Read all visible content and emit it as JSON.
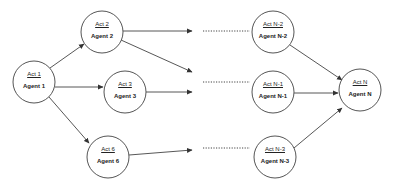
{
  "diagram": {
    "nodes": [
      {
        "id": "act1",
        "act": "Act 1",
        "agent": "Agent 1",
        "cx": 34,
        "cy": 82
      },
      {
        "id": "act2",
        "act": "Act 2",
        "agent": "Agent 2",
        "cx": 102,
        "cy": 32
      },
      {
        "id": "act3",
        "act": "Act 3",
        "agent": "Agent 3",
        "cx": 125,
        "cy": 92
      },
      {
        "id": "act6",
        "act": "Act 6",
        "agent": "Agent 6",
        "cx": 108,
        "cy": 157
      },
      {
        "id": "actn2",
        "act": "Act N-2",
        "agent": "Agent N-2",
        "cx": 273,
        "cy": 32
      },
      {
        "id": "actn1",
        "act": "Act N-1",
        "agent": "Agent N-1",
        "cx": 273,
        "cy": 92
      },
      {
        "id": "actn3",
        "act": "Act N-3",
        "agent": "Agent N-3",
        "cx": 275,
        "cy": 157
      },
      {
        "id": "actn",
        "act": "Act N",
        "agent": "Agent N",
        "cx": 360,
        "cy": 90
      }
    ],
    "edges": [
      {
        "from": "act1",
        "to": "act2"
      },
      {
        "from": "act1",
        "to": "act3"
      },
      {
        "from": "act1",
        "to": "act6"
      },
      {
        "from": "act2",
        "to": "open",
        "note": "arrow to ellipsis toward N-2"
      },
      {
        "from": "act2",
        "to": "open",
        "note": "arrow to ellipsis toward N-1"
      },
      {
        "from": "act3",
        "to": "open",
        "note": "arrow to ellipsis toward N-1"
      },
      {
        "from": "act6",
        "to": "open",
        "note": "arrow to ellipsis toward N-3"
      },
      {
        "from": "actn2",
        "to": "actn"
      },
      {
        "from": "actn1",
        "to": "actn"
      },
      {
        "from": "actn3",
        "to": "actn"
      }
    ],
    "ellipses": [
      "......",
      "......",
      "......"
    ]
  }
}
